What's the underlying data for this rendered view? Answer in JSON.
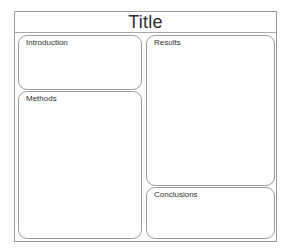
{
  "poster": {
    "title": "Title",
    "panels": [
      {
        "id": "introduction",
        "label": "Introduction",
        "body": "",
        "column": "left"
      },
      {
        "id": "methods",
        "label": "Methods",
        "body": "",
        "column": "left"
      },
      {
        "id": "results",
        "label": "Results",
        "body": "",
        "column": "right"
      },
      {
        "id": "conclusions",
        "label": "Conclusions",
        "body": "",
        "column": "right"
      }
    ]
  },
  "colors": {
    "page_background": "#ffffff",
    "frame_border": "#999a9c",
    "panel_border": "#9b9c9e",
    "title_divider": "#a8a9ab",
    "title_text": "#2e2e2e",
    "label_text": "#2f2f2f",
    "panel_fill": "#ffffff"
  }
}
